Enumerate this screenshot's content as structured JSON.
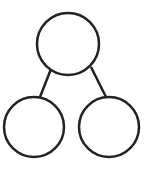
{
  "diagram": {
    "type": "tree",
    "stroke_color": "#222222",
    "background": "#ffffff",
    "nodes": [
      {
        "id": "root",
        "cx": 68,
        "cy": 44,
        "r": 31,
        "label": ""
      },
      {
        "id": "left-child",
        "cx": 34,
        "cy": 127,
        "r": 30,
        "label": ""
      },
      {
        "id": "right-child",
        "cx": 109,
        "cy": 127,
        "r": 30,
        "label": ""
      }
    ],
    "edges": [
      {
        "from": "root",
        "to": "left-child",
        "x1": 51,
        "y1": 69,
        "x2": 40,
        "y2": 97
      },
      {
        "from": "root",
        "to": "right-child",
        "x1": 91,
        "y1": 67,
        "x2": 106,
        "y2": 97
      }
    ]
  }
}
